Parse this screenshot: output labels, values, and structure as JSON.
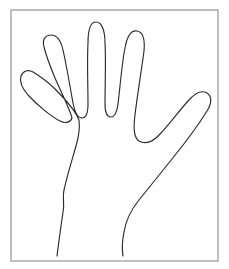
{
  "image": {
    "title": "Hand outline line drawing",
    "subject": "left-hand-outline",
    "description": "Black line-art outline of an open human hand with five spread fingers, palm toward viewer, traced inside a thin rectangular border",
    "width_px": 229,
    "height_px": 269,
    "background_color": "#ffffff",
    "line_color": "#2b2b2b",
    "frame_color": "#8a8a8a",
    "line_width_px": 1.15,
    "style": "line-art-outline",
    "fill": "none"
  },
  "frame": {
    "name": "rectangular-border",
    "x": 11,
    "y": 10,
    "width": 207,
    "height": 251,
    "stroke_color": "#8a8a8a",
    "stroke_width_px": 1.1
  },
  "hand": {
    "orientation": "fingers-up",
    "side": "left-hand-palm-view",
    "open": true,
    "finger_count": 5,
    "outline_closed": false,
    "wrist_open_at_bottom": true,
    "fingers": [
      {
        "name": "pinky-finger",
        "label": "Pinky",
        "tip_x": 28,
        "tip_y": 73,
        "angle_deg": -35
      },
      {
        "name": "ring-finger",
        "label": "Ring",
        "tip_x": 57,
        "tip_y": 36,
        "angle_deg": -14
      },
      {
        "name": "middle-finger",
        "label": "Middle",
        "tip_x": 92,
        "tip_y": 21,
        "angle_deg": -2
      },
      {
        "name": "index-finger",
        "label": "Index",
        "tip_x": 124,
        "tip_y": 30,
        "angle_deg": 8
      },
      {
        "name": "thumb",
        "label": "Thumb",
        "tip_x": 203,
        "tip_y": 94,
        "angle_deg": 55
      }
    ],
    "valleys": [
      {
        "name": "pinky-ring-valley",
        "x": 48,
        "y": 116
      },
      {
        "name": "ring-middle-valley",
        "x": 77,
        "y": 118
      },
      {
        "name": "middle-index-valley",
        "x": 108,
        "y": 110
      },
      {
        "name": "index-thumb-web",
        "x": 150,
        "y": 141
      }
    ],
    "wrist": {
      "name": "wrist-opening",
      "left_x": 57,
      "right_x": 123,
      "y": 256
    },
    "outline_path": "M57,256 C59,240 61,226 63,212 C65,203 62,198 64,190 C67,176 72,160 76,146 C79,136 80,128 79,120 C76,112 64,98 55,89 C46,80 38,75 33,72 C28,69 23,71 21,76 C19,82 22,88 28,95 C38,106 52,117 60,121 C66,124 71,122 72,118 C70,110 62,94 55,78 C50,66 46,55 44,47 C42,40 45,35 51,35 C57,35 61,41 63,50 C66,63 70,86 73,103 C75,113 78,118 82,118 C86,118 88,113 88,104 C88,88 87,60 88,43 C88,32 90,22 96,22 C102,22 105,31 105,43 C106,60 105,88 105,104 C105,112 107,117 111,117 C115,117 117,112 118,104 C120,88 122,62 125,48 C127,37 131,30 137,31 C143,32 145,40 144,51 C142,67 137,97 135,115 C133,130 134,138 139,141 C146,145 154,141 161,133 C170,123 180,110 188,101 C195,93 202,90 207,93 C212,96 212,103 207,111 C199,124 185,143 172,159 C160,174 148,189 139,200 C130,211 126,220 124,232 C122,242 122,250 123,256",
    "segments": [
      {
        "name": "left-wrist-edge",
        "from": "wrist-left",
        "to": "pinky-base"
      },
      {
        "name": "pinky-outline",
        "from": "pinky-base",
        "to": "pinky-ring-valley"
      },
      {
        "name": "ring-outline",
        "from": "pinky-ring-valley",
        "to": "ring-middle-valley"
      },
      {
        "name": "middle-outline",
        "from": "ring-middle-valley",
        "to": "middle-index-valley"
      },
      {
        "name": "index-outline",
        "from": "middle-index-valley",
        "to": "index-thumb-web"
      },
      {
        "name": "thumb-outline",
        "from": "index-thumb-web",
        "to": "thumb-base"
      },
      {
        "name": "right-wrist-edge",
        "from": "thumb-base",
        "to": "wrist-right"
      }
    ]
  }
}
